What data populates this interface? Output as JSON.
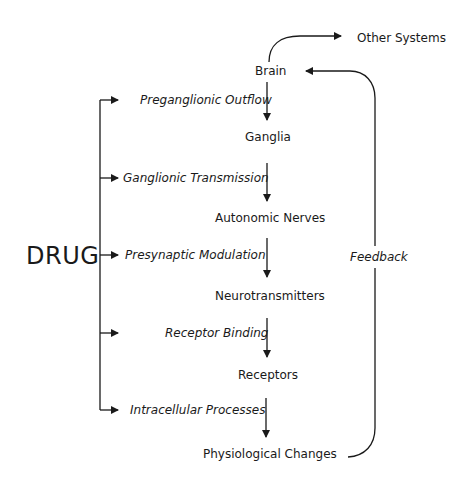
{
  "diagram": {
    "source": "DRUG",
    "nodes": [
      {
        "id": "brain",
        "label": "Brain"
      },
      {
        "id": "ganglia",
        "label": "Ganglia"
      },
      {
        "id": "autonomic-nerves",
        "label": "Autonomic Nerves"
      },
      {
        "id": "neurotransmitters",
        "label": "Neurotransmitters"
      },
      {
        "id": "receptors",
        "label": "Receptors"
      },
      {
        "id": "physiological-changes",
        "label": "Physiological Changes"
      },
      {
        "id": "other-systems",
        "label": "Other Systems"
      }
    ],
    "processes": [
      {
        "id": "preganglionic-outflow",
        "label": "Preganglionic Outflow"
      },
      {
        "id": "ganglionic-transmission",
        "label": "Ganglionic Transmission"
      },
      {
        "id": "presynaptic-modulation",
        "label": "Presynaptic Modulation"
      },
      {
        "id": "receptor-binding",
        "label": "Receptor Binding"
      },
      {
        "id": "intracellular-processes",
        "label": "Intracellular Processes"
      }
    ],
    "feedback_label": "Feedback",
    "line_color": "#1a1a1a"
  }
}
